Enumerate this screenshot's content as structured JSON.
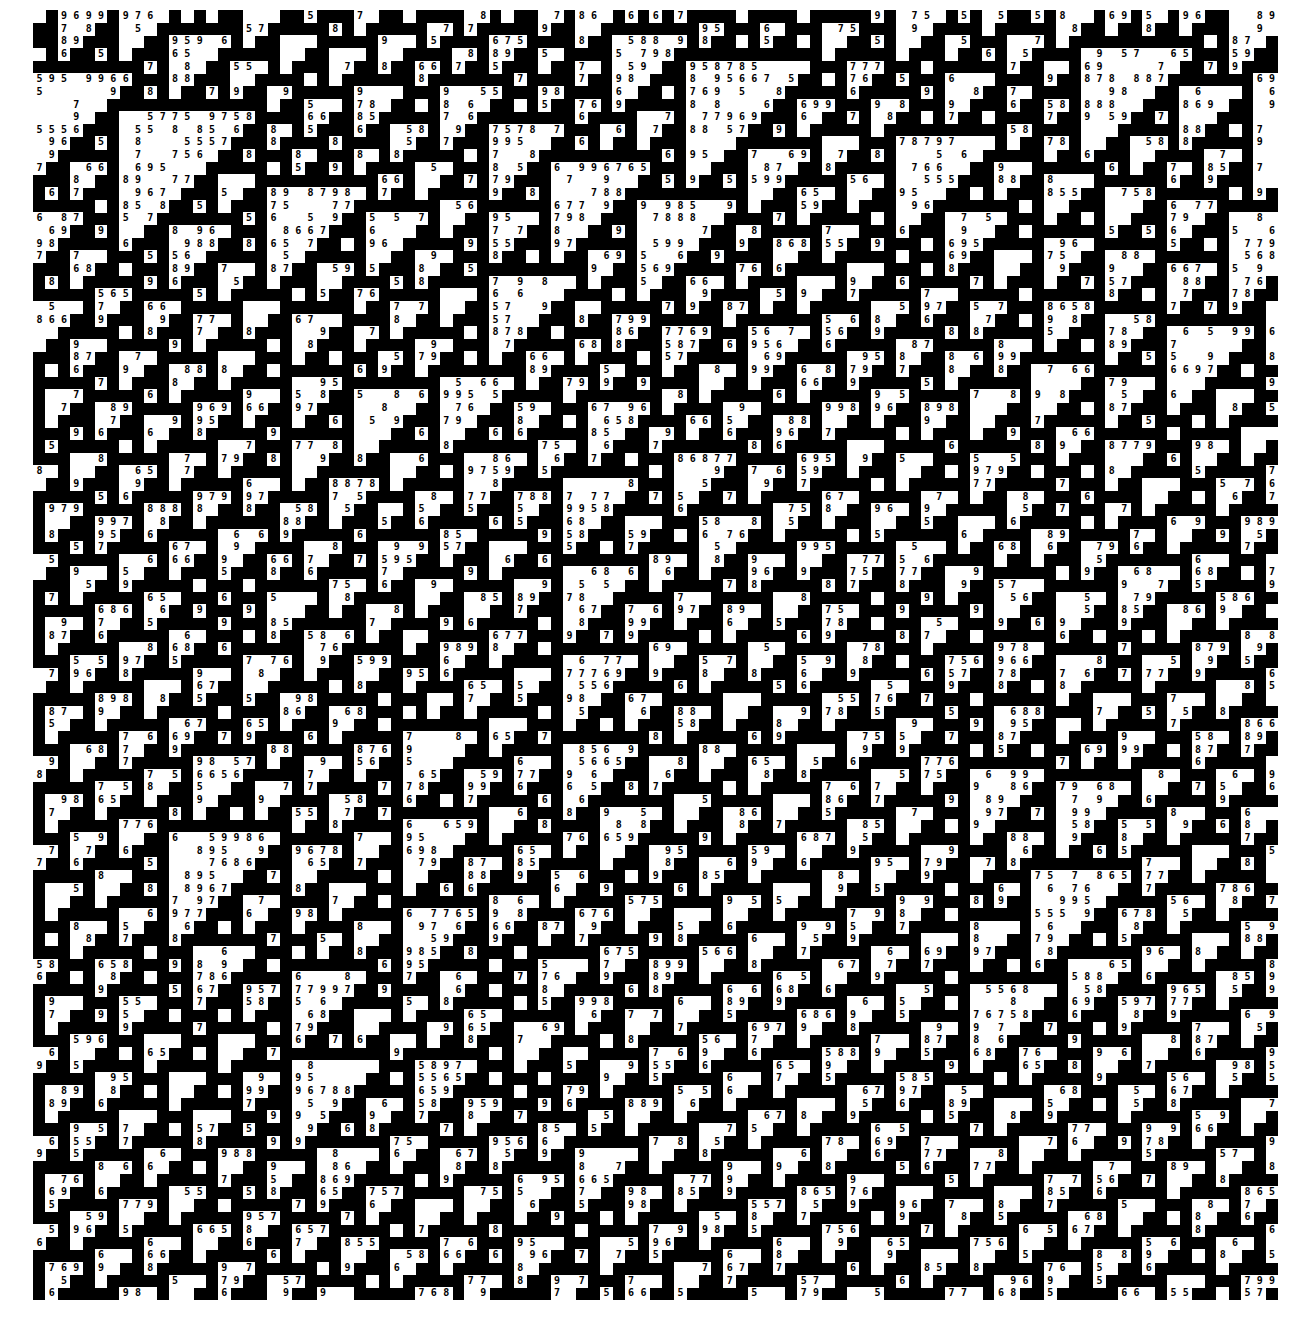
{
  "figure": {
    "digit_alphabet": [
      "5",
      "6",
      "7",
      "8",
      "9"
    ],
    "colors": {
      "on": "#000000",
      "off": "#ffffff",
      "digit": "#000000",
      "page": "#ffffff"
    },
    "grid": {
      "left": 33,
      "top": 10,
      "width": 1245,
      "height": 1290,
      "columns": 101,
      "rows": 102
    },
    "visible_top_row_sample": [
      "5",
      "6",
      "5",
      "7",
      "8",
      "5",
      "5",
      "6",
      "9"
    ],
    "visible_bottom_row_sample": [
      "7",
      "8",
      "9",
      "5",
      "5",
      "6",
      "5",
      "6",
      "5",
      "9"
    ]
  }
}
